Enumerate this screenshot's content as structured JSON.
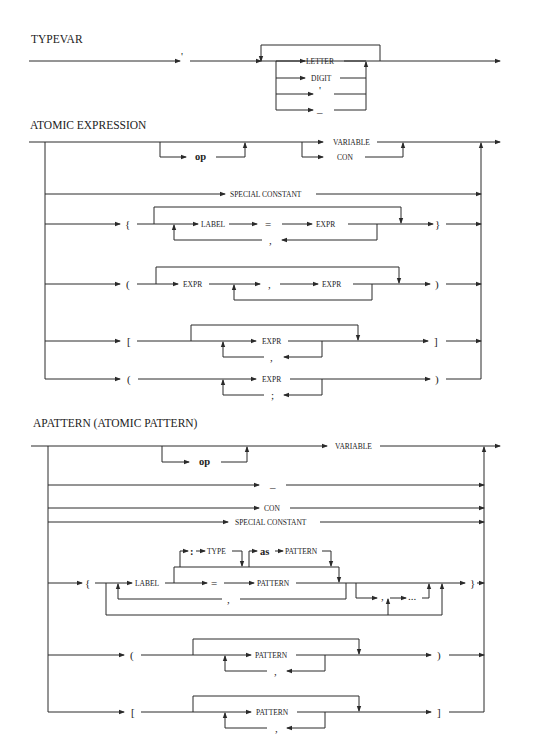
{
  "sections": [
    {
      "title": "TYPEVAR",
      "tokens": {
        "quote": "'",
        "alternatives": [
          "LETTER",
          "DIGIT",
          "'",
          "_"
        ]
      }
    },
    {
      "title": "ATOMIC EXPRESSION",
      "rows": {
        "op": "op",
        "variable": "VARIABLE",
        "con": "CON",
        "special_constant": "SPECIAL CONSTANT",
        "record": {
          "open": "{",
          "label": "LABEL",
          "eq": "=",
          "expr": "EXPR",
          "sep": ",",
          "close": "}"
        },
        "tuple": {
          "open": "(",
          "expr1": "EXPR",
          "sep": ",",
          "expr2": "EXPR",
          "close": ")"
        },
        "list": {
          "open": "[",
          "expr": "EXPR",
          "sep": ",",
          "close": "]"
        },
        "sequence": {
          "open": "(",
          "expr": "EXPR",
          "sep": ";",
          "close": ")"
        }
      }
    },
    {
      "title": "APATTERN (ATOMIC PATTERN)",
      "rows": {
        "op": "op",
        "variable": "VARIABLE",
        "wildcard": "_",
        "con": "CON",
        "special_constant": "SPECIAL CONSTANT",
        "record": {
          "open": "{",
          "label": "LABEL",
          "colon": ":",
          "type": "TYPE",
          "as": "as",
          "as_pattern": "PATTERN",
          "eq": "=",
          "pattern": "PATTERN",
          "sep": ",",
          "wild_sep": ",",
          "ellipsis": "...",
          "close": "}"
        },
        "tuple": {
          "open": "(",
          "pattern": "PATTERN",
          "sep": ",",
          "close": ")"
        },
        "list": {
          "open": "[",
          "pattern": "PATTERN",
          "sep": ",",
          "close": "]"
        }
      }
    }
  ]
}
